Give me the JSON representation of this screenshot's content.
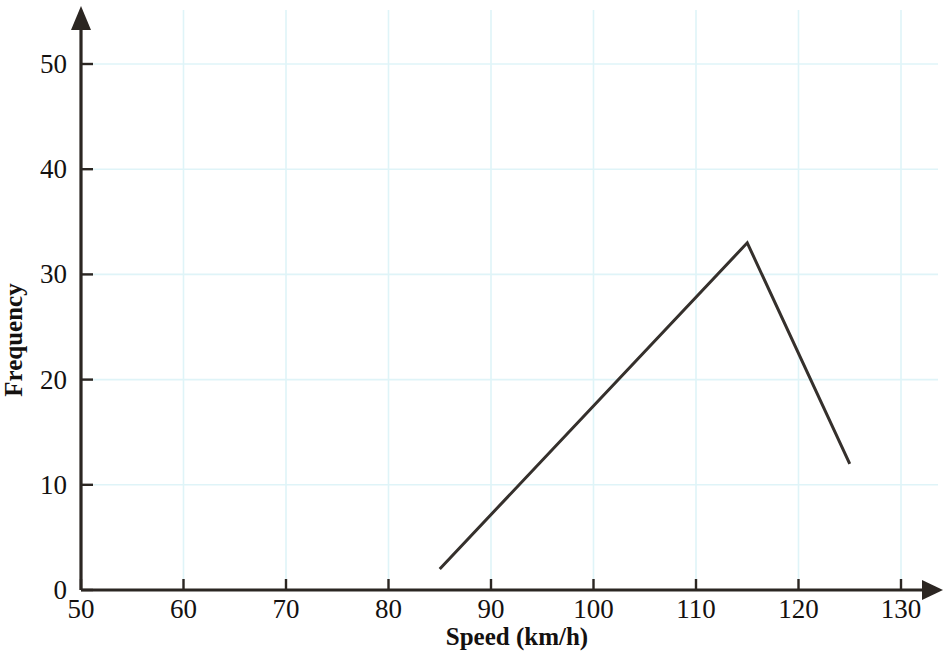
{
  "chart_data": {
    "type": "line",
    "title": "",
    "subtitle": "",
    "xlabel": "Speed (km/h)",
    "ylabel": "Frequency",
    "xlim": [
      50,
      133
    ],
    "ylim": [
      0,
      53
    ],
    "xticks": [
      50,
      60,
      70,
      80,
      90,
      100,
      110,
      120,
      130
    ],
    "yticks": [
      0,
      10,
      20,
      30,
      40,
      50
    ],
    "xtick_labels": [
      "50",
      "60",
      "70",
      "80",
      "90",
      "100",
      "110",
      "120",
      "130"
    ],
    "ytick_labels": [
      "0",
      "10",
      "20",
      "30",
      "40",
      "50"
    ],
    "grid": true,
    "grid_color": "#dff4f8",
    "legend": false,
    "legend_position": "none",
    "axis_color": "#2b2622",
    "line_color": "#35302c",
    "series": [
      {
        "name": "Frequency polygon",
        "x": [
          85,
          115,
          125
        ],
        "values": [
          2,
          33,
          12
        ]
      }
    ],
    "annotations": []
  },
  "axis_titles": {
    "x": "Speed (km/h)",
    "y": "Frequency"
  },
  "icons": {
    "x_axis_arrow": "arrow-right-icon",
    "y_axis_arrow": "arrow-up-icon"
  }
}
